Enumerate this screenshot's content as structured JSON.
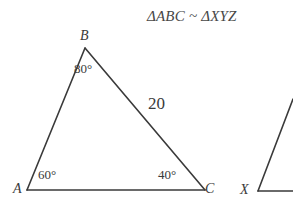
{
  "figure": {
    "title": "ΔABC ~ ΔXYZ",
    "background_color": "#ffffff",
    "stroke_color": "#3a3a3a",
    "text_color": "#3a3a3a",
    "triangles": [
      {
        "name": "triangle-ABC",
        "complete": true,
        "vertices": [
          {
            "label": "A",
            "x": 27,
            "y": 190,
            "angle": "60°"
          },
          {
            "label": "B",
            "x": 85,
            "y": 48,
            "angle": "80°"
          },
          {
            "label": "C",
            "x": 205,
            "y": 190,
            "angle": "40°"
          }
        ],
        "sides": [
          {
            "from": "A",
            "to": "B",
            "length_label": ""
          },
          {
            "from": "B",
            "to": "C",
            "length_label": "20"
          },
          {
            "from": "A",
            "to": "C",
            "length_label": ""
          }
        ]
      },
      {
        "name": "triangle-XYZ",
        "complete": false,
        "note_visible_part": "vertex X with one rising edge and baseline cropped at right edge",
        "vertices": [
          {
            "label": "X",
            "x": 258,
            "y": 191,
            "angle": ""
          }
        ]
      }
    ]
  },
  "labels": {
    "vertex_A": "A",
    "vertex_B": "B",
    "vertex_C": "C",
    "vertex_X": "X",
    "angle_A": "60°",
    "angle_B": "80°",
    "angle_C": "40°",
    "side_BC": "20"
  }
}
